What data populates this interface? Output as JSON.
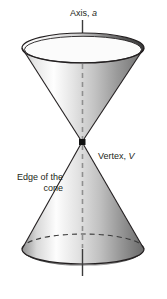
{
  "figure": {
    "background_color": "#ffffff",
    "width": 167,
    "height": 299
  },
  "labels": {
    "axis": {
      "text": "Axis, ",
      "symbol": "a",
      "full": "Axis, a"
    },
    "vertex": {
      "text": "Vertex, ",
      "symbol": "V",
      "full": "Vertex, V"
    },
    "edge_line1": "Edge of the",
    "edge_line2": "cone",
    "edge_full": "Edge of the cone"
  },
  "colors": {
    "stroke": "#231f20",
    "axis_line": "#3b3b3b",
    "dashed_axis": "#8a8a8a",
    "shade_light": "#ffffff",
    "shade_mid": "#c9c9c9",
    "shade_dark": "#2f2f2f",
    "vertex_dot": "#111111",
    "text": "#231f20"
  },
  "geometry": {
    "vertex": {
      "x": 82,
      "y": 142
    },
    "axis_top_y": 20,
    "axis_bottom_y": 276,
    "upper_rim": {
      "cx": 83,
      "cy": 48,
      "rx": 61,
      "ry": 15
    },
    "lower_rim": {
      "cx": 83,
      "cy": 249,
      "rx": 61,
      "ry": 15
    },
    "upper_front_y": 63,
    "lower_back_arc_y": 234,
    "dash_start_y": 64,
    "dash_end_y": 248
  }
}
